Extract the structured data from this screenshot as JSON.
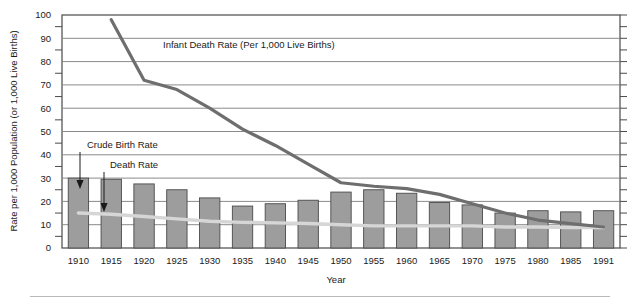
{
  "chart_data": {
    "type": "bar",
    "title": "",
    "xlabel": "Year",
    "ylabel": "Rate per 1,000 Population (or 1,000 Live Births)",
    "ylim": [
      0,
      100
    ],
    "ytick_step": 10,
    "yminor_step": 5,
    "grid": "horizontal-major",
    "legend_position": "inline-annotations",
    "categories": [
      "1910",
      "1915",
      "1920",
      "1925",
      "1930",
      "1935",
      "1940",
      "1945",
      "1950",
      "1955",
      "1960",
      "1965",
      "1970",
      "1975",
      "1980",
      "1985",
      "1991"
    ],
    "yticks": [
      "0",
      "10",
      "20",
      "30",
      "40",
      "50",
      "60",
      "70",
      "80",
      "90",
      "100"
    ],
    "series": [
      {
        "name": "Crude Birth Rate",
        "type": "bar",
        "color": "#9d9d9d",
        "values": [
          30,
          29.5,
          27.5,
          25,
          21.5,
          18,
          19,
          20.5,
          24,
          25,
          23.5,
          19.5,
          18.5,
          15,
          16,
          15.5,
          16
        ]
      },
      {
        "name": "Death Rate",
        "type": "line",
        "color": "#d6d6d6",
        "values": [
          15,
          14.5,
          13.5,
          12.5,
          11.5,
          11,
          10.8,
          10.5,
          10,
          9.5,
          9.5,
          9.5,
          9.5,
          9,
          9,
          8.8,
          8.8
        ]
      },
      {
        "name": "Infant Death Rate (Per 1,000 Live Births)",
        "type": "line",
        "color": "#6e6e6e",
        "x": [
          "1915",
          "1920",
          "1925",
          "1930",
          "1935",
          "1940",
          "1945",
          "1950",
          "1955",
          "1960",
          "1965",
          "1970",
          "1975",
          "1980",
          "1985",
          "1991"
        ],
        "values": [
          98,
          72,
          68,
          60,
          51,
          44,
          36,
          28,
          26.5,
          25.5,
          23,
          19,
          15,
          12,
          10.5,
          9
        ]
      }
    ],
    "annotations": [
      {
        "text": "Infant Death Rate (Per 1,000 Live Births)",
        "x": 1927,
        "y": 84
      },
      {
        "text": "Crude Birth Rate",
        "x": 1913,
        "y": 43
      },
      {
        "text": "Death Rate",
        "x": 1917,
        "y": 36
      }
    ]
  },
  "axes": {
    "x_title": "Year",
    "y_title": "Rate per 1,000 Population (or 1,000 Live Births)"
  },
  "colors": {
    "bar_fill": "#9d9d9d",
    "bar_stroke": "#4a4a4a",
    "infant_line": "#6e6e6e",
    "death_line": "#d6d6d6",
    "grid": "#8a8a8a",
    "axis": "#4a4a4a",
    "footer_rule": "#b9b9b9"
  }
}
